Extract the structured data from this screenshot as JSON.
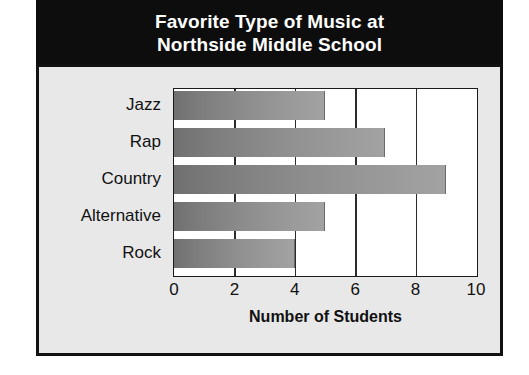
{
  "chart_data": {
    "type": "bar",
    "orientation": "horizontal",
    "title": "Favorite Type of Music at Northside Middle School",
    "title_lines": [
      "Favorite Type of Music at",
      "Northside Middle School"
    ],
    "categories": [
      "Jazz",
      "Rap",
      "Country",
      "Alternative",
      "Rock"
    ],
    "values": [
      5,
      7,
      9,
      5,
      4
    ],
    "xlabel": "Number of Students",
    "ylabel": "",
    "xlim": [
      0,
      10
    ],
    "xticks": [
      0,
      2,
      4,
      6,
      8,
      10
    ],
    "xtick_labels": [
      "0",
      "2",
      "4",
      "6",
      "8",
      "10"
    ],
    "grid": "vertical",
    "legend": null,
    "colors": {
      "title_background": "#0d0d0d",
      "title_text": "#ffffff",
      "panel_background": "#e8e8e8",
      "plot_background": "#ffffff",
      "bar_gradient_start": "#707070",
      "bar_gradient_end": "#a2a2a2",
      "axis_line": "#1a1a1a",
      "text": "#111111"
    }
  }
}
